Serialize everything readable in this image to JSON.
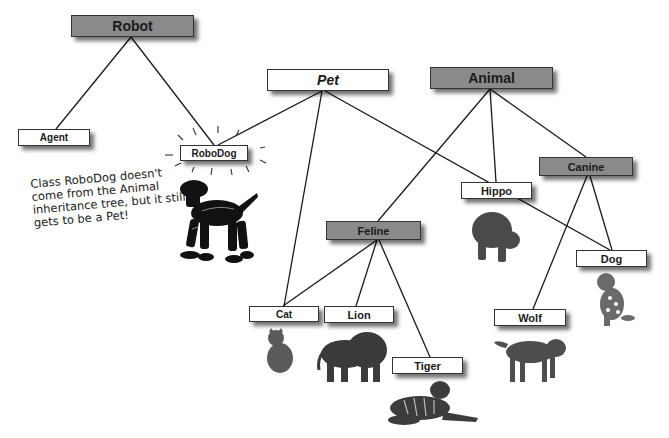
{
  "diagram": {
    "type": "class inheritance tree",
    "nodes": {
      "robot": {
        "label": "Robot",
        "style": "gray"
      },
      "agent": {
        "label": "Agent",
        "style": "white"
      },
      "robodog": {
        "label": "RoboDog",
        "style": "white"
      },
      "pet": {
        "label": "Pet",
        "style": "white-italic"
      },
      "animal": {
        "label": "Animal",
        "style": "gray"
      },
      "hippo": {
        "label": "Hippo",
        "style": "white"
      },
      "canine": {
        "label": "Canine",
        "style": "gray"
      },
      "feline": {
        "label": "Feline",
        "style": "gray"
      },
      "dog": {
        "label": "Dog",
        "style": "white"
      },
      "cat": {
        "label": "Cat",
        "style": "white"
      },
      "lion": {
        "label": "Lion",
        "style": "white"
      },
      "tiger": {
        "label": "Tiger",
        "style": "white"
      },
      "wolf": {
        "label": "Wolf",
        "style": "white"
      }
    },
    "edges": [
      {
        "from": "Robot",
        "to": "Agent"
      },
      {
        "from": "Robot",
        "to": "RoboDog"
      },
      {
        "from": "Pet",
        "to": "RoboDog"
      },
      {
        "from": "Pet",
        "to": "Cat"
      },
      {
        "from": "Pet",
        "to": "Dog"
      },
      {
        "from": "Animal",
        "to": "Feline"
      },
      {
        "from": "Animal",
        "to": "Hippo"
      },
      {
        "from": "Animal",
        "to": "Canine"
      },
      {
        "from": "Canine",
        "to": "Wolf"
      },
      {
        "from": "Canine",
        "to": "Dog"
      },
      {
        "from": "Feline",
        "to": "Cat"
      },
      {
        "from": "Feline",
        "to": "Lion"
      },
      {
        "from": "Feline",
        "to": "Tiger"
      }
    ],
    "annotation": {
      "lines": [
        "Class RoboDog doesn't",
        "come from the Animal",
        "inheritance tree, but it still",
        "gets to be a Pet!"
      ]
    },
    "images": [
      {
        "name": "robot-dog",
        "under": "RoboDog"
      },
      {
        "name": "hippo",
        "under": "Hippo"
      },
      {
        "name": "dalmatian-dog",
        "under": "Dog"
      },
      {
        "name": "cat",
        "under": "Cat"
      },
      {
        "name": "lion",
        "under": "Lion"
      },
      {
        "name": "tiger",
        "under": "Tiger"
      },
      {
        "name": "wolf",
        "under": "Wolf"
      }
    ],
    "colors": {
      "gray_box": "#8a8a8a",
      "white_box": "#ffffff",
      "line": "#1a1a1a"
    }
  }
}
